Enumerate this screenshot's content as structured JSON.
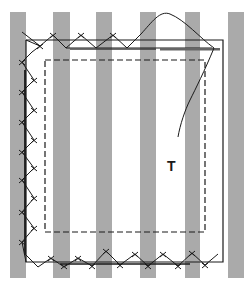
{
  "diagram": {
    "label": "T",
    "colors": {
      "stripe": "#aaaaaa",
      "line": "#1a1a1a",
      "background": "#ffffff"
    },
    "stripes_x": [
      10,
      53,
      96,
      140,
      185,
      228
    ],
    "stripe_width": 16,
    "stripe_top": 12,
    "stripe_bottom": 278
  }
}
